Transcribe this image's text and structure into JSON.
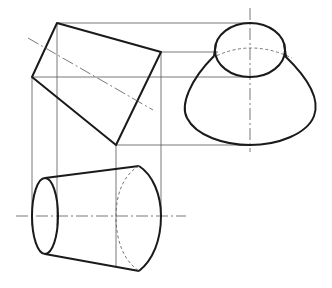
{
  "figure": {
    "views": [
      {
        "name": "inclined-frustum-outline",
        "shape": "quadrilateral",
        "vertices": [
          [
            57,
            23
          ],
          [
            161,
            52
          ],
          [
            116,
            145
          ],
          [
            32,
            77
          ]
        ]
      },
      {
        "name": "upright-frustum-view",
        "top_ellipse": {
          "cx": 250,
          "cy": 50,
          "rx": 35,
          "ry": 27
        },
        "base_ellipse": {
          "cx": 250,
          "cy": 95,
          "rx": 66,
          "ry": 50
        }
      },
      {
        "name": "horizontal-frustum-view",
        "small_end": {
          "cx": 45,
          "cy": 216,
          "rx": 13,
          "ry": 38
        },
        "large_end": {
          "cx": 140,
          "cy": 216,
          "rx": 21,
          "ry": 53
        }
      }
    ],
    "colors": {
      "outline": "#1a1a1a",
      "projection_lines": "#555555",
      "background": "#ffffff"
    }
  }
}
